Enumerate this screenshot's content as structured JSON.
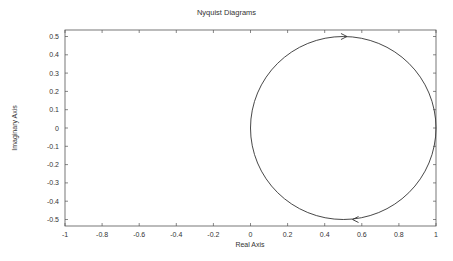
{
  "chart_data": {
    "type": "line",
    "title": "Nyquist Diagrams",
    "xlabel": "Real Axis",
    "ylabel": "Imaginary Axis",
    "xlim": [
      -1,
      1
    ],
    "ylim": [
      -0.55,
      0.55
    ],
    "grid": false,
    "legend": null,
    "x_ticks": [
      "-1",
      "-0.8",
      "-0.6",
      "-0.4",
      "-0.2",
      "0",
      "0.2",
      "0.4",
      "0.6",
      "0.8",
      "1"
    ],
    "y_ticks": [
      "0.5",
      "0.4",
      "0.3",
      "0.2",
      "0.1",
      "0",
      "-0.1",
      "-0.2",
      "-0.3",
      "-0.4",
      "-0.5"
    ],
    "series": [
      {
        "name": "Nyquist curve",
        "shape": "circle",
        "center": [
          0.5,
          0
        ],
        "radius": 0.5,
        "x": [
          0,
          0.146,
          0.5,
          0.854,
          1,
          0.854,
          0.5,
          0.146,
          0
        ],
        "y": [
          0,
          0.354,
          0.5,
          0.354,
          0,
          -0.354,
          -0.5,
          -0.354,
          0
        ],
        "direction_arrows": [
          {
            "at": [
              0.52,
              0.5
            ],
            "direction": "right"
          },
          {
            "at": [
              0.55,
              -0.5
            ],
            "direction": "left"
          }
        ]
      }
    ]
  }
}
